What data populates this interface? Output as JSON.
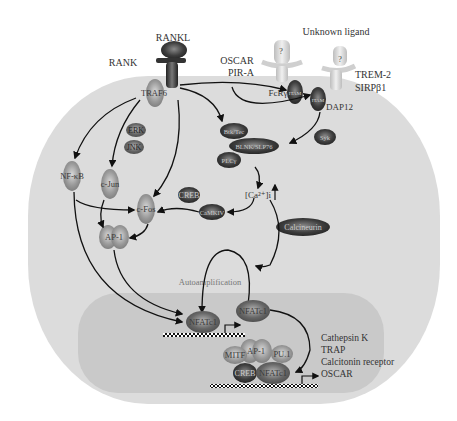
{
  "ligands": {
    "rankl": "RANKL",
    "unknown_ligand": "Unknown ligand",
    "question_mark": "?"
  },
  "receptors": {
    "rank": "RANK",
    "oscar": "OSCAR",
    "pira": "PIR-A",
    "trem2": "TREM-2",
    "sirpb1": "SIRPβ1"
  },
  "adaptors": {
    "traf6": "TRAF6",
    "fcrg": "FcRγ",
    "dap12": "DAP12",
    "itam": "ITAM"
  },
  "cytoplasm": {
    "erk": "ERK",
    "jnk": "JNK",
    "nfkb": "NF-κB",
    "cjun": "c-Jun",
    "cfos": "c-Fos",
    "ap1": "AP-1",
    "creb": "CREB",
    "camkiv": "CaMKIV",
    "btk_tec": "Btk/Tec",
    "blnk_slp76": "BLNK/SLP76",
    "plcg": "PLCγ",
    "syk": "Syk",
    "calcium": "[Ca²⁺]i",
    "calcineurin": "Calcineurin",
    "autoamplification": "Autoamplification"
  },
  "nucleus": {
    "nfatc1_a": "NFATc1",
    "nfatc1_b": "NFATc1",
    "nfatc1_c": "NFATc1",
    "mitf": "MITF",
    "ap1": "AP-1",
    "pu1": "PU.1",
    "creb": "CREB",
    "target_genes": [
      "Cathepsin K",
      "TRAP",
      "Calcitonin receptor",
      "OSCAR"
    ]
  },
  "colors": {
    "cell": "#dcdcdc",
    "nucleus": "#cbcbcb",
    "arrow": "#111111",
    "autoamp_text": "#777777"
  }
}
